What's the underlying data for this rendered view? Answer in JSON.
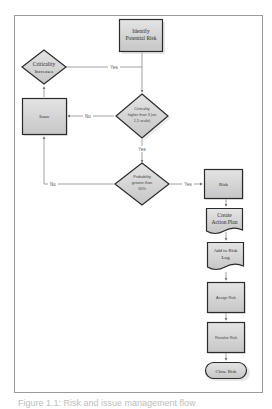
{
  "nodes": {
    "identify": {
      "label_1": "Identify",
      "label_2": "Potential Risk"
    },
    "criticality_increases": {
      "label_1": "Criticality",
      "label_2": "Increases"
    },
    "criticality_check": {
      "label_1": "Criticality",
      "label_2": "higher than 3 (on",
      "label_3": "1-5 scale)"
    },
    "issue": {
      "label": "Issue"
    },
    "probability_check": {
      "label_1": "Probability",
      "label_2": "greater than",
      "label_3": "50%"
    },
    "risk": {
      "label": "Risk"
    },
    "create_action_plan": {
      "label_1": "Create",
      "label_2": "Action Plan"
    },
    "add_to_risk_log": {
      "label_1": "Add to Risk",
      "label_2": "Log"
    },
    "assign_risk": {
      "label": "Assign Risk"
    },
    "resolve_risk": {
      "label": "Resolve Risk"
    },
    "close_risk": {
      "label": "Close Risk"
    }
  },
  "edges": {
    "yes_to_increases": "Yes",
    "no_to_issue": "No",
    "yes_to_probability": "Yes",
    "no_prob_to_issue": "No",
    "yes_to_risk": "Yes"
  },
  "caption": "Figure 1.1: Risk and issue management flow",
  "colors": {
    "node_fill": "#d6d6d6",
    "node_border": "#2b2b2b",
    "edge": "#8a8a8a",
    "frame": "#9a9a9a"
  }
}
